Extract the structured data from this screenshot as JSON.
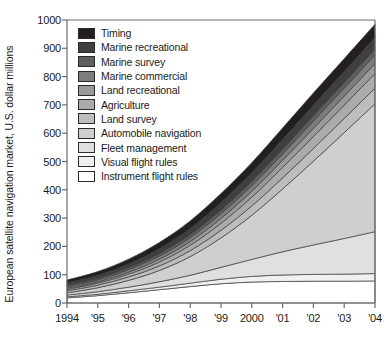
{
  "chart_data": {
    "type": "area",
    "stacked": true,
    "title": "",
    "xlabel": "",
    "ylabel": "European satellite navigation market, U.S. dollar millions",
    "ylim": [
      0,
      1000
    ],
    "yticks": [
      0,
      100,
      200,
      300,
      400,
      500,
      600,
      700,
      800,
      900,
      1000
    ],
    "ytick_labels": [
      "0",
      "100",
      "200",
      "300",
      "400",
      "500",
      "600",
      "700",
      "800",
      "900",
      "1000"
    ],
    "grid": false,
    "legend_position": "inside-top-left",
    "categories": [
      "1994",
      "1995",
      "1996",
      "1997",
      "1998",
      "1999",
      "2000",
      "2001",
      "2002",
      "2003",
      "2004"
    ],
    "x": [
      1994,
      1995,
      1996,
      1997,
      1998,
      1999,
      2000,
      2001,
      2002,
      2003,
      2004
    ],
    "xtick_labels": [
      "1994",
      "'95",
      "'96",
      "'97",
      "'98",
      "'99",
      "2000",
      "'01",
      "'02",
      "'03",
      "'04"
    ],
    "series": [
      {
        "name": "Instrument flight rules",
        "color": "#ffffff",
        "values": [
          18,
          26,
          36,
          47,
          58,
          68,
          74,
          76,
          77,
          77,
          78
        ]
      },
      {
        "name": "Visual flight rules",
        "color": "#f0f0f0",
        "values": [
          4,
          5,
          7,
          9,
          12,
          16,
          20,
          23,
          24,
          25,
          26
        ]
      },
      {
        "name": "Fleet management",
        "color": "#e0e0e0",
        "values": [
          6,
          9,
          13,
          19,
          28,
          42,
          60,
          82,
          104,
          126,
          148
        ]
      },
      {
        "name": "Automobile navigation",
        "color": "#cfcfcf",
        "values": [
          8,
          14,
          24,
          40,
          66,
          104,
          156,
          222,
          296,
          374,
          452
        ]
      },
      {
        "name": "Land survey",
        "color": "#bdbdbd",
        "values": [
          7,
          9,
          12,
          16,
          21,
          27,
          33,
          39,
          45,
          50,
          55
        ]
      },
      {
        "name": "Agriculture",
        "color": "#ababab",
        "values": [
          5,
          7,
          10,
          14,
          19,
          25,
          31,
          37,
          42,
          47,
          52
        ]
      },
      {
        "name": "Land recreational",
        "color": "#9a9a9a",
        "values": [
          4,
          5,
          7,
          10,
          13,
          17,
          21,
          25,
          29,
          32,
          35
        ]
      },
      {
        "name": "Marine commercial",
        "color": "#7d7d7d",
        "values": [
          6,
          7,
          9,
          11,
          14,
          17,
          20,
          23,
          26,
          28,
          30
        ]
      },
      {
        "name": "Marine survey",
        "color": "#5e5e5e",
        "values": [
          5,
          6,
          7,
          9,
          11,
          13,
          15,
          17,
          19,
          20,
          21
        ]
      },
      {
        "name": "Marine recreational",
        "color": "#3f3f3f",
        "values": [
          8,
          10,
          13,
          17,
          21,
          26,
          30,
          34,
          37,
          39,
          41
        ]
      },
      {
        "name": "Timing",
        "color": "#231f20",
        "values": [
          10,
          13,
          17,
          22,
          27,
          32,
          36,
          40,
          43,
          45,
          47
        ]
      }
    ],
    "legend_order_top_to_bottom": [
      "Timing",
      "Marine recreational",
      "Marine survey",
      "Marine commercial",
      "Land recreational",
      "Agriculture",
      "Land survey",
      "Automobile navigation",
      "Fleet management",
      "Visual flight rules",
      "Instrument flight rules"
    ],
    "axis_color": "#6b6b6b",
    "text_color": "#1a1a1a"
  }
}
